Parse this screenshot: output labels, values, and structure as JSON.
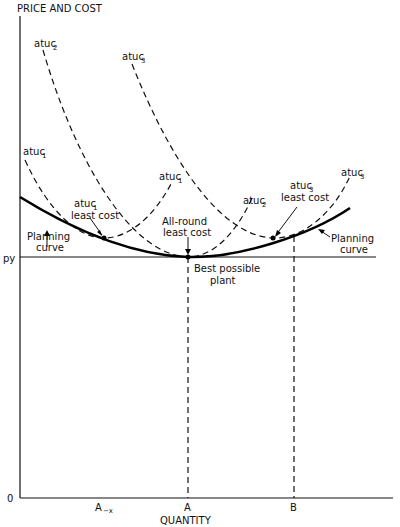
{
  "diagram": {
    "y_axis_label": "PRICE AND COST",
    "x_axis_label": "QUANTITY",
    "origin_label": "0",
    "price_line_label": "py",
    "x_ticks": [
      {
        "label": "A",
        "sub": "−x",
        "full": "A−x"
      },
      {
        "label": "A"
      },
      {
        "label": "B"
      }
    ],
    "curves": {
      "atuc1": {
        "name": "atuc",
        "sub": "1"
      },
      "atuc2": {
        "name": "atuc",
        "sub": "2"
      },
      "atuc3": {
        "name": "atuc",
        "sub": "3"
      }
    },
    "annotations": {
      "atuc1_least_cost_line1": "atuc",
      "atuc1_least_cost_sub": "1",
      "atuc1_least_cost_line2": "least cost",
      "atuc3_least_cost_line1": "atuc",
      "atuc3_least_cost_sub": "3",
      "atuc3_least_cost_line2": "least cost",
      "allround_line1": "All-round",
      "allround_line2": "least cost",
      "best_line1": "Best possible",
      "best_line2": "plant",
      "planning_left_line1": "Planning",
      "planning_left_line2": "curve",
      "planning_right_line1": "Planning",
      "planning_right_line2": "curve"
    }
  }
}
